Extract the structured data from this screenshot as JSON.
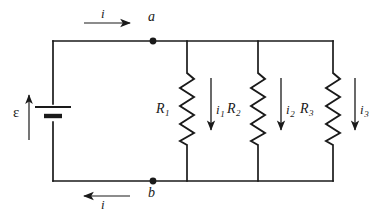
{
  "figure": {
    "name": "parallel-resistor-circuit",
    "background_color": "#ffffff",
    "line_color": "#1a1a1a"
  },
  "source": {
    "emf_label": "ε",
    "emf_arrow_direction": "up",
    "symbol": "battery"
  },
  "nodes": [
    {
      "id": "node-a",
      "label": "a"
    },
    {
      "id": "node-b",
      "label": "b"
    }
  ],
  "currents": [
    {
      "id": "current-main-top",
      "label": "i",
      "subscript": "",
      "direction": "right"
    },
    {
      "id": "current-main-bottom",
      "label": "i",
      "subscript": "",
      "direction": "left"
    },
    {
      "id": "current-branch-1",
      "label": "i",
      "subscript": "1",
      "direction": "down"
    },
    {
      "id": "current-branch-2",
      "label": "i",
      "subscript": "2",
      "direction": "down"
    },
    {
      "id": "current-branch-3",
      "label": "i",
      "subscript": "3",
      "direction": "down"
    }
  ],
  "resistors": [
    {
      "id": "resistor-1",
      "label": "R",
      "subscript": "1"
    },
    {
      "id": "resistor-2",
      "label": "R",
      "subscript": "2"
    },
    {
      "id": "resistor-3",
      "label": "R",
      "subscript": "3"
    }
  ]
}
